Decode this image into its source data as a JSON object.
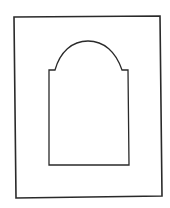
{
  "figure": {
    "description": "Line drawing of a rectangular frame containing an arch-topped window opening",
    "stroke_color": "#2a2a2a",
    "background_color": "#ffffff",
    "outer_frame": {
      "corners": [
        [
          14,
          17
        ],
        [
          160,
          16
        ],
        [
          162,
          196
        ],
        [
          16,
          198
        ]
      ]
    },
    "inner_opening": {
      "left_x": 49,
      "right_x": 129,
      "bottom_y": 165,
      "shoulder_y": 70,
      "left_shoulder_x": 55,
      "right_shoulder_x": 122,
      "arch_apex_y": 41
    }
  }
}
